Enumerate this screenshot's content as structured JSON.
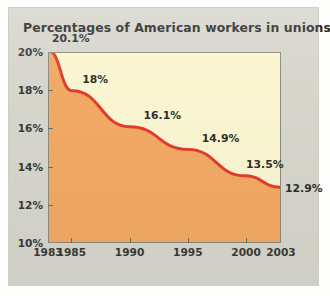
{
  "chart_data": {
    "type": "area",
    "title": "Percentages of American workers in unions",
    "xlabel": "",
    "ylabel": "",
    "x": [
      1983,
      1985,
      1990,
      1995,
      2000,
      2003
    ],
    "values": [
      20.1,
      18.0,
      16.1,
      14.9,
      13.5,
      12.9
    ],
    "point_labels": [
      "20.1%",
      "18%",
      "16.1%",
      "14.9%",
      "13.5%",
      "12.9%"
    ],
    "xtick_labels": [
      "1983",
      "1985",
      "1990",
      "1995",
      "2000",
      "2003"
    ],
    "ytick_labels": [
      "10%",
      "12%",
      "14%",
      "16%",
      "18%",
      "20%"
    ],
    "ytick_values": [
      10,
      12,
      14,
      16,
      18,
      20
    ],
    "ylim": [
      10,
      20
    ],
    "xlim": [
      1983,
      2003
    ],
    "grid": false,
    "legend": "none",
    "colors": {
      "line": "#e23b2e",
      "area_fill": "#f2a964",
      "plot_background": "#faf6d2",
      "panel_background": "#d6d6cd",
      "axis": "#8b8b7e",
      "text": "#2f2f2b"
    }
  }
}
